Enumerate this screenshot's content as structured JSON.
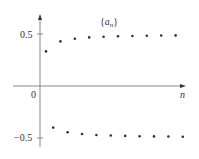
{
  "chart_data": {
    "type": "scatter",
    "xlabel": "n",
    "ylabel": "",
    "ylim": [
      -0.6,
      0.7
    ],
    "yticks": [
      0.5,
      -0.5
    ],
    "ytick_labels": [
      "0.5",
      "−0.5"
    ],
    "origin_label": "0",
    "grid": false,
    "series": [
      {
        "name": "a_n",
        "x": [
          1,
          2,
          3,
          4,
          5,
          6,
          7,
          8,
          9,
          10,
          11,
          12,
          13,
          14,
          15,
          16,
          17,
          18,
          19,
          20
        ],
        "values": [
          0.333,
          -0.4,
          0.429,
          -0.444,
          0.455,
          -0.462,
          0.467,
          -0.471,
          0.474,
          -0.476,
          0.478,
          -0.48,
          0.481,
          -0.483,
          0.484,
          -0.485,
          0.486,
          -0.486,
          0.487,
          -0.488
        ]
      }
    ]
  },
  "labels": {
    "title_set": "{",
    "title_a": "a",
    "title_n": "n",
    "title_close": "}",
    "x_axis": "n",
    "y_pos": "0.5",
    "y_neg": "−0.5",
    "origin": "0"
  },
  "colors": {
    "axis": "#888888",
    "point": "#333333"
  }
}
